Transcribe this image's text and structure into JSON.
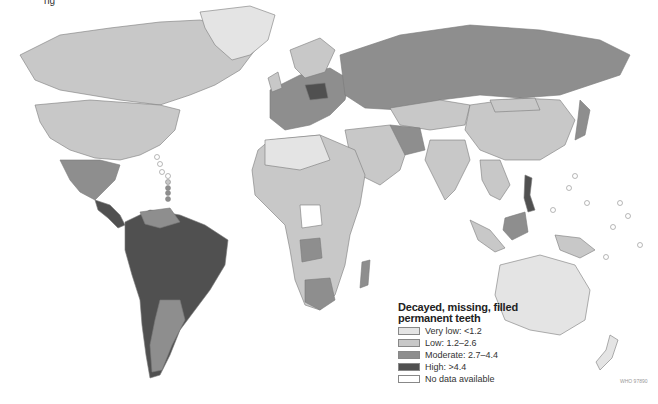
{
  "header": {
    "partial_title": "ng"
  },
  "legend": {
    "title_line1": "Decayed, missing, filled",
    "title_line2": "permanent teeth",
    "items": [
      {
        "label": "Very low: <1.2",
        "color": "#e4e4e4"
      },
      {
        "label": "Low: 1.2–2.6",
        "color": "#c8c8c8"
      },
      {
        "label": "Moderate: 2.7–4.4",
        "color": "#8e8e8e"
      },
      {
        "label": "High: >4.4",
        "color": "#505050"
      },
      {
        "label": "No data available",
        "color": "#ffffff"
      }
    ]
  },
  "credit": "WHO 97890",
  "colors": {
    "very_low": "#e4e4e4",
    "low": "#c8c8c8",
    "moderate": "#8e8e8e",
    "high": "#505050",
    "no_data": "#ffffff",
    "border": "#7a7a7a"
  }
}
